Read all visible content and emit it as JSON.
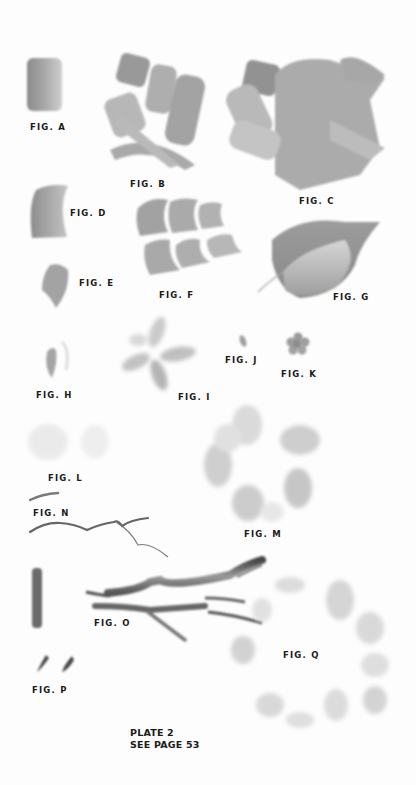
{
  "page": {
    "plate_title": "PLATE 2",
    "plate_reference": "SEE PAGE 53"
  },
  "figures": [
    {
      "id": "A",
      "label": "FIG. A"
    },
    {
      "id": "B",
      "label": "FIG. B"
    },
    {
      "id": "C",
      "label": "FIG. C"
    },
    {
      "id": "D",
      "label": "FIG. D"
    },
    {
      "id": "E",
      "label": "FIG. E"
    },
    {
      "id": "F",
      "label": "FIG. F"
    },
    {
      "id": "G",
      "label": "FIG. G"
    },
    {
      "id": "H",
      "label": "FIG. H"
    },
    {
      "id": "I",
      "label": "FIG. I"
    },
    {
      "id": "J",
      "label": "FIG. J"
    },
    {
      "id": "K",
      "label": "FIG. K"
    },
    {
      "id": "L",
      "label": "FIG. L"
    },
    {
      "id": "M",
      "label": "FIG. M"
    },
    {
      "id": "N",
      "label": "FIG. N"
    },
    {
      "id": "O",
      "label": "FIG. O"
    },
    {
      "id": "P",
      "label": "FIG. P"
    },
    {
      "id": "Q",
      "label": "FIG. Q"
    }
  ],
  "colors": {
    "paper": "#fdfdfd",
    "stroke_dark": "#6e6e6e",
    "stroke_mid": "#9a9a9a",
    "stroke_light": "#c8c8c8",
    "text": "#1a1a1a"
  }
}
